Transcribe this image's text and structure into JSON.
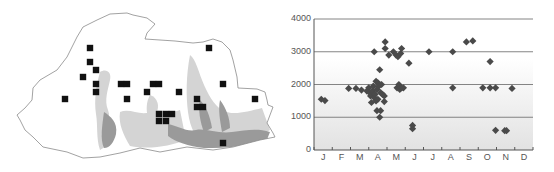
{
  "map": {
    "title": "",
    "outline_points": [
      [
        97,
        20
      ],
      [
        110,
        14
      ],
      [
        127,
        13
      ],
      [
        133,
        15
      ],
      [
        147,
        18
      ],
      [
        155,
        24
      ],
      [
        147,
        33
      ],
      [
        145,
        39
      ],
      [
        160,
        40
      ],
      [
        175,
        41
      ],
      [
        193,
        43
      ],
      [
        203,
        42
      ],
      [
        213,
        39
      ],
      [
        222,
        42
      ],
      [
        230,
        50
      ],
      [
        233,
        60
      ],
      [
        237,
        77
      ],
      [
        238,
        88
      ],
      [
        257,
        89
      ],
      [
        265,
        92
      ],
      [
        267,
        100
      ],
      [
        268,
        105
      ],
      [
        273,
        107
      ],
      [
        270,
        115
      ],
      [
        267,
        123
      ],
      [
        273,
        133
      ],
      [
        275,
        137
      ],
      [
        260,
        140
      ],
      [
        233,
        147
      ],
      [
        213,
        150
      ],
      [
        187,
        147
      ],
      [
        160,
        152
      ],
      [
        140,
        148
      ],
      [
        120,
        153
      ],
      [
        100,
        157
      ],
      [
        83,
        158
      ],
      [
        67,
        152
      ],
      [
        43,
        147
      ],
      [
        33,
        137
      ],
      [
        25,
        130
      ],
      [
        20,
        120
      ],
      [
        17,
        115
      ],
      [
        25,
        108
      ],
      [
        32,
        100
      ],
      [
        33,
        88
      ],
      [
        40,
        80
      ],
      [
        57,
        70
      ],
      [
        67,
        57
      ],
      [
        77,
        37
      ],
      [
        83,
        27
      ],
      [
        97,
        20
      ]
    ],
    "record_squares": [
      [
        90,
        48
      ],
      [
        209,
        48
      ],
      [
        90,
        62
      ],
      [
        96,
        70
      ],
      [
        83,
        77
      ],
      [
        96,
        84
      ],
      [
        121,
        84
      ],
      [
        127,
        84
      ],
      [
        153,
        84
      ],
      [
        159,
        84
      ],
      [
        223,
        84
      ],
      [
        96,
        92
      ],
      [
        147,
        92
      ],
      [
        179,
        92
      ],
      [
        65,
        99
      ],
      [
        127,
        99
      ],
      [
        197,
        99
      ],
      [
        255,
        99
      ],
      [
        197,
        107
      ],
      [
        203,
        107
      ],
      [
        159,
        114
      ],
      [
        166,
        114
      ],
      [
        172,
        114
      ],
      [
        159,
        121
      ],
      [
        166,
        121
      ],
      [
        223,
        143
      ]
    ],
    "colors": {
      "outline": "#8a8a8a",
      "square": "#111111",
      "terrain_light": "#cfcfcf",
      "terrain_dark": "#8c8c8c"
    }
  },
  "chart_data": {
    "type": "scatter",
    "title": "",
    "xlabel": "",
    "ylabel": "",
    "x_tick_labels": [
      "J",
      "F",
      "M",
      "A",
      "M",
      "J",
      "J",
      "A",
      "S",
      "O",
      "N",
      "D"
    ],
    "y_ticks": [
      0,
      1000,
      2000,
      3000,
      4000
    ],
    "ylim": [
      0,
      4000
    ],
    "xlim": [
      0,
      12
    ],
    "grid": "horizontal",
    "marker": "diamond",
    "marker_color": "#4a4a4a",
    "background_gradient": [
      "#ffffff",
      "#e4e4e4"
    ],
    "points": [
      {
        "month": 0.4,
        "altitude": 1550
      },
      {
        "month": 0.6,
        "altitude": 1510
      },
      {
        "month": 1.9,
        "altitude": 1880
      },
      {
        "month": 2.3,
        "altitude": 1880
      },
      {
        "month": 2.6,
        "altitude": 1830
      },
      {
        "month": 2.9,
        "altitude": 1800
      },
      {
        "month": 3.0,
        "altitude": 1900
      },
      {
        "month": 3.05,
        "altitude": 1750
      },
      {
        "month": 3.1,
        "altitude": 1650
      },
      {
        "month": 3.15,
        "altitude": 1450
      },
      {
        "month": 3.2,
        "altitude": 1800
      },
      {
        "month": 3.25,
        "altitude": 1950
      },
      {
        "month": 3.3,
        "altitude": 1600
      },
      {
        "month": 3.3,
        "altitude": 3000
      },
      {
        "month": 3.35,
        "altitude": 1700
      },
      {
        "month": 3.4,
        "altitude": 2100
      },
      {
        "month": 3.4,
        "altitude": 1500
      },
      {
        "month": 3.45,
        "altitude": 1850
      },
      {
        "month": 3.45,
        "altitude": 1200
      },
      {
        "month": 3.5,
        "altitude": 2050
      },
      {
        "month": 3.5,
        "altitude": 1550
      },
      {
        "month": 3.55,
        "altitude": 1950
      },
      {
        "month": 3.6,
        "altitude": 2000
      },
      {
        "month": 3.6,
        "altitude": 2450
      },
      {
        "month": 3.6,
        "altitude": 1000
      },
      {
        "month": 3.65,
        "altitude": 1750
      },
      {
        "month": 3.65,
        "altitude": 1200
      },
      {
        "month": 3.7,
        "altitude": 2000
      },
      {
        "month": 3.75,
        "altitude": 1700
      },
      {
        "month": 3.85,
        "altitude": 1650
      },
      {
        "month": 3.85,
        "altitude": 1480
      },
      {
        "month": 3.9,
        "altitude": 3300
      },
      {
        "month": 3.9,
        "altitude": 3100
      },
      {
        "month": 4.1,
        "altitude": 2900
      },
      {
        "month": 4.35,
        "altitude": 3000
      },
      {
        "month": 4.5,
        "altitude": 2900
      },
      {
        "month": 4.55,
        "altitude": 1900
      },
      {
        "month": 4.6,
        "altitude": 2850
      },
      {
        "month": 4.65,
        "altitude": 2000
      },
      {
        "month": 4.7,
        "altitude": 1850
      },
      {
        "month": 4.75,
        "altitude": 2950
      },
      {
        "month": 4.8,
        "altitude": 1900
      },
      {
        "month": 4.8,
        "altitude": 3100
      },
      {
        "month": 4.9,
        "altitude": 1900
      },
      {
        "month": 5.2,
        "altitude": 2650
      },
      {
        "month": 5.4,
        "altitude": 750
      },
      {
        "month": 5.4,
        "altitude": 650
      },
      {
        "month": 6.3,
        "altitude": 3000
      },
      {
        "month": 7.6,
        "altitude": 1900
      },
      {
        "month": 7.6,
        "altitude": 3000
      },
      {
        "month": 8.35,
        "altitude": 3300
      },
      {
        "month": 8.7,
        "altitude": 3330
      },
      {
        "month": 9.25,
        "altitude": 1900
      },
      {
        "month": 9.65,
        "altitude": 2700
      },
      {
        "month": 9.65,
        "altitude": 1900
      },
      {
        "month": 9.95,
        "altitude": 1900
      },
      {
        "month": 9.95,
        "altitude": 600
      },
      {
        "month": 10.45,
        "altitude": 590
      },
      {
        "month": 10.55,
        "altitude": 590
      },
      {
        "month": 10.85,
        "altitude": 1880
      }
    ]
  }
}
